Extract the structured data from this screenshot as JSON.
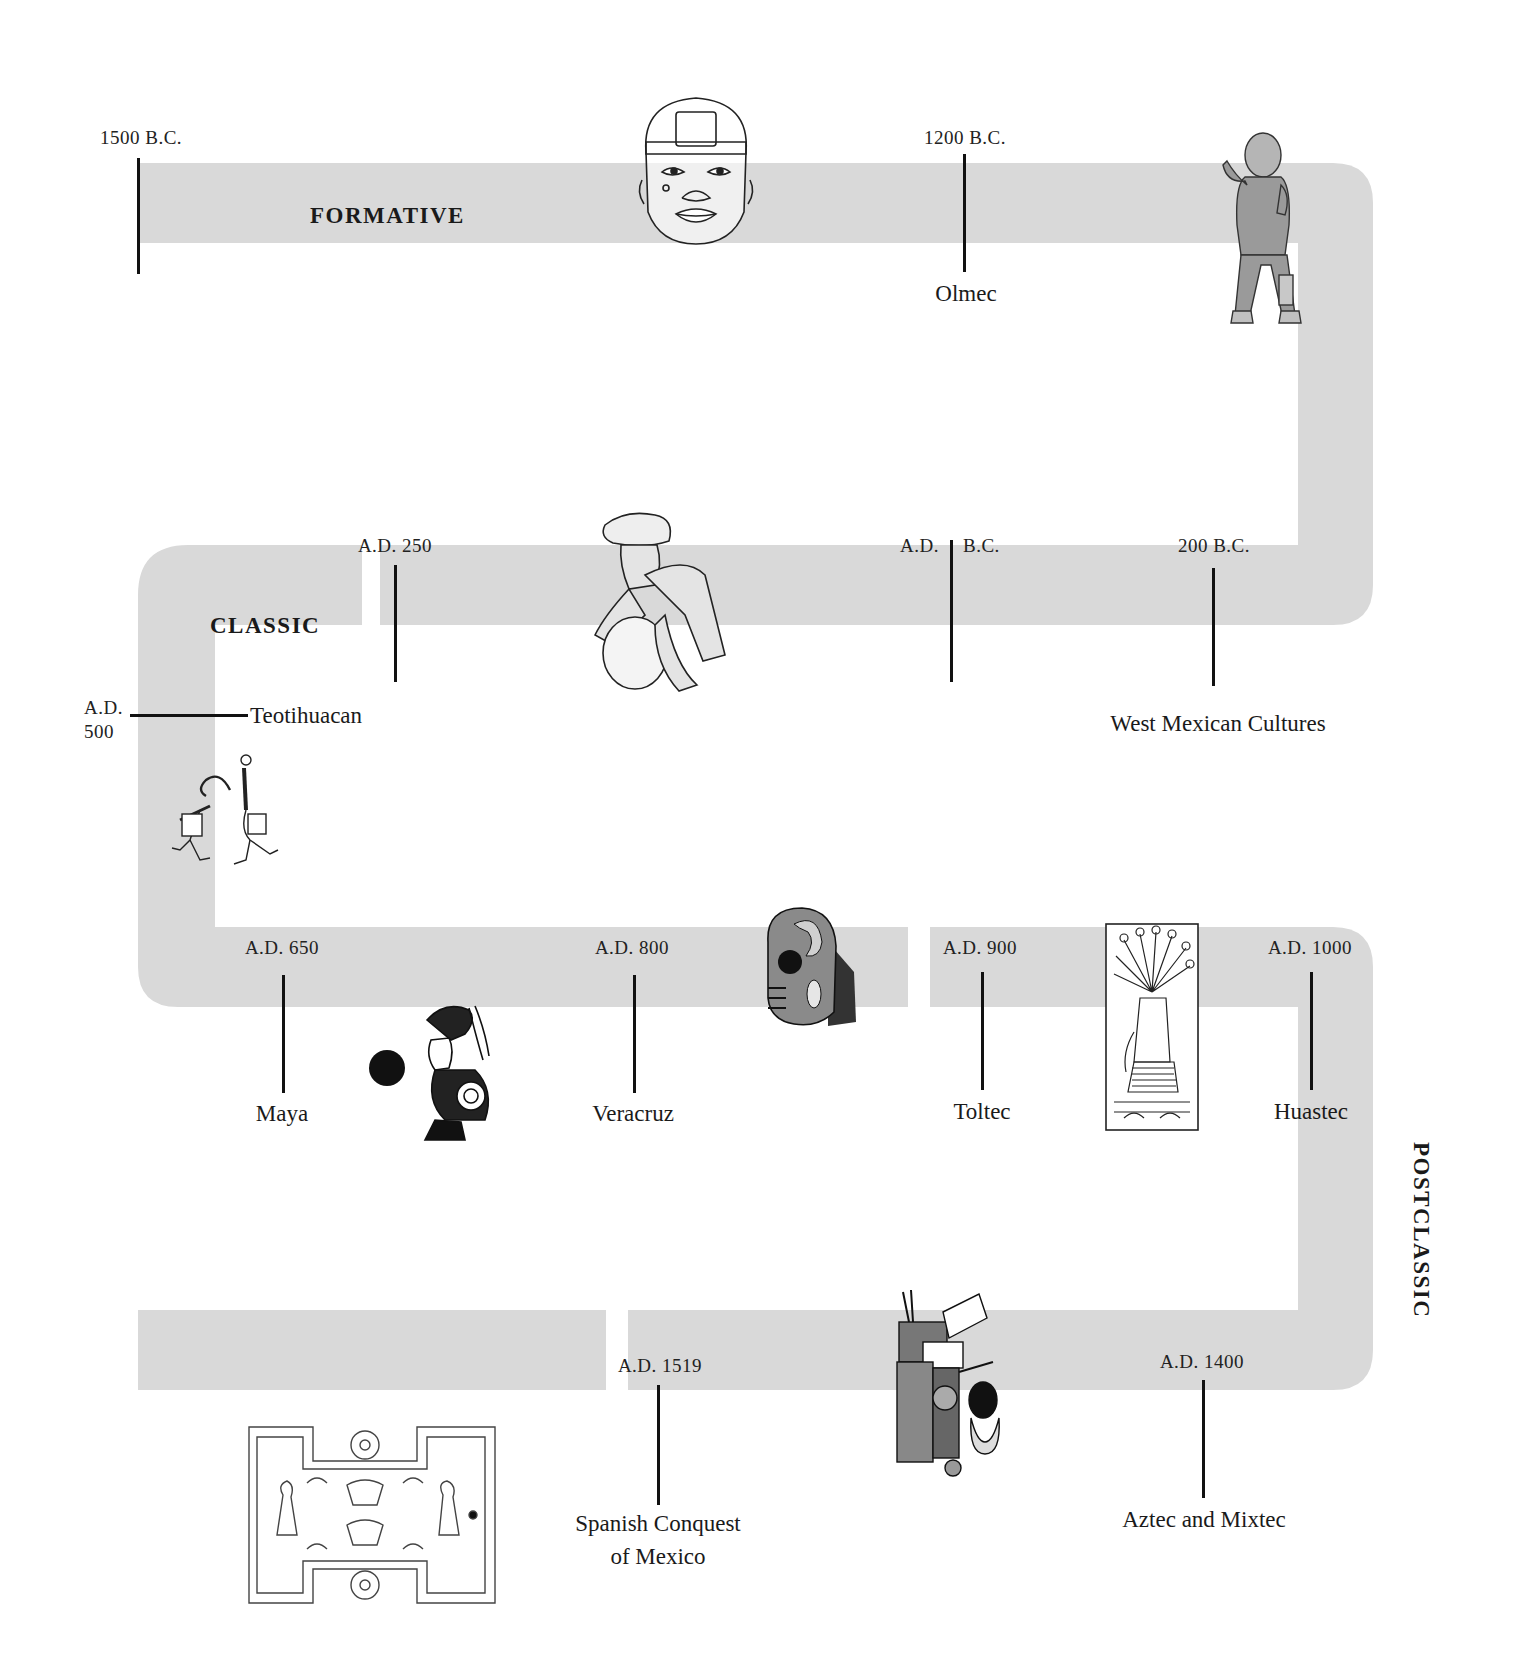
{
  "diagram": {
    "type": "serpentine-timeline",
    "band_color": "#d9d9d9",
    "tick_color": "#111111"
  },
  "periods": {
    "formative": "FORMATIVE",
    "classic": "CLASSIC",
    "postclassic": "POSTCLASSIC"
  },
  "dates": {
    "d1500bc": "1500 B.C.",
    "d1200bc": "1200 B.C.",
    "d200bc": "200 B.C.",
    "era_ad": "A.D.",
    "era_bc": "B.C.",
    "d250ad": "A.D. 250",
    "d500ad_line1": "A.D.",
    "d500ad_line2": "500",
    "d650ad": "A.D. 650",
    "d800ad": "A.D. 800",
    "d900ad": "A.D. 900",
    "d1000ad": "A.D. 1000",
    "d1400ad": "A.D. 1400",
    "d1519ad": "A.D. 1519"
  },
  "cultures": {
    "olmec": "Olmec",
    "west_mexican": "West Mexican Cultures",
    "teotihuacan": "Teotihuacan",
    "maya": "Maya",
    "veracruz": "Veracruz",
    "toltec": "Toltec",
    "huastec": "Huastec",
    "aztec_mixtec": "Aztec and Mixtec",
    "spanish_conquest_line1": "Spanish Conquest",
    "spanish_conquest_line2": "of Mexico"
  },
  "artifacts": [
    {
      "name": "olmec-colossal-head",
      "near": "FORMATIVE"
    },
    {
      "name": "olmec-standing-figurine",
      "near": "Olmec"
    },
    {
      "name": "west-mexican-seated-figure",
      "near": "A.D. 250"
    },
    {
      "name": "teotihuacan-ballplayers-mural",
      "near": "Teotihuacan"
    },
    {
      "name": "maya-ballplayer-drawing",
      "near": "Maya"
    },
    {
      "name": "veracruz-stone-hacha-skull",
      "near": "Veracruz"
    },
    {
      "name": "huastec-relief-panel",
      "near": "Huastec"
    },
    {
      "name": "aztec-mixtec-codex-deity",
      "near": "Aztec and Mixtec"
    },
    {
      "name": "ballcourt-codex-drawing",
      "near": "Spanish Conquest"
    }
  ]
}
